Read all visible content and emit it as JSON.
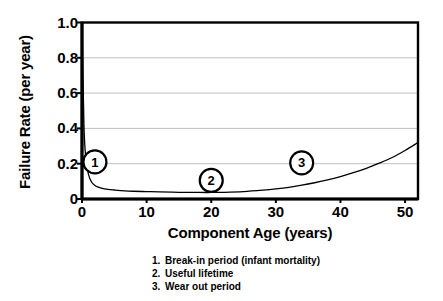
{
  "chart_data": {
    "type": "line",
    "title": "",
    "xlabel": "Component Age (years)",
    "ylabel": "Failure Rate (per year)",
    "xlim": [
      0,
      52
    ],
    "ylim": [
      0,
      1.0
    ],
    "grid": true,
    "legend_position": "below-axes",
    "xticks": [
      0,
      10,
      20,
      30,
      40,
      50
    ],
    "xtick_labels": [
      "0",
      "10",
      "20",
      "30",
      "40",
      "50"
    ],
    "yticks": [
      0,
      0.2,
      0.4,
      0.6,
      0.8,
      1.0
    ],
    "ytick_labels": [
      "0",
      "0.2",
      "0.4",
      "0.6",
      "0.8",
      "1.0"
    ],
    "series": [
      {
        "name": "Failure rate (bathtub curve)",
        "color": "#000000",
        "x": [
          0,
          0.3,
          0.6,
          1.0,
          1.5,
          2.0,
          2.5,
          3.0,
          4.0,
          5.0,
          6.0,
          8.0,
          10.0,
          12.0,
          15.0,
          18.0,
          20.0,
          22.0,
          25.0,
          28.0,
          30.0,
          32.0,
          34.0,
          36.0,
          38.0,
          40.0,
          42.0,
          44.0,
          46.0,
          48.0,
          50.0,
          52.0
        ],
        "y": [
          1.0,
          0.42,
          0.23,
          0.14,
          0.095,
          0.077,
          0.068,
          0.062,
          0.055,
          0.051,
          0.048,
          0.044,
          0.042,
          0.04,
          0.038,
          0.037,
          0.037,
          0.038,
          0.042,
          0.05,
          0.057,
          0.066,
          0.078,
          0.092,
          0.108,
          0.127,
          0.149,
          0.174,
          0.203,
          0.235,
          0.275,
          0.32
        ]
      }
    ],
    "annotations": [
      {
        "label": "1",
        "x": 2.0,
        "y": 0.21,
        "region": "Break-in period (infant mortality)"
      },
      {
        "label": "2",
        "x": 20.0,
        "y": 0.105,
        "region": "Useful lifetime"
      },
      {
        "label": "3",
        "x": 34.0,
        "y": 0.205,
        "region": "Wear out period"
      }
    ]
  },
  "notes": [
    {
      "num": "1.",
      "text": "Break-in period (infant mortality)"
    },
    {
      "num": "2.",
      "text": "Useful lifetime"
    },
    {
      "num": "3.",
      "text": "Wear out period"
    }
  ],
  "colors": {
    "axis": "#000000",
    "grid": "#bfbfbf",
    "curve": "#000000",
    "background": "#ffffff"
  }
}
